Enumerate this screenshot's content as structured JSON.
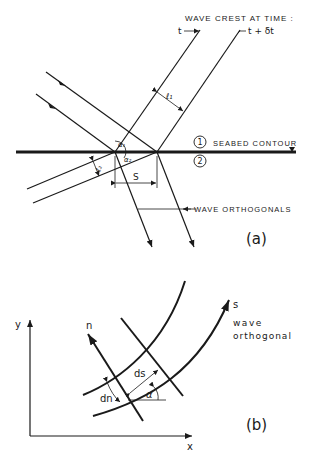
{
  "figure_a": {
    "title": "WAVE CREST AT TIME :",
    "time_t": "t",
    "time_t_dt": "t + δt",
    "label_l1": "ℓ₁",
    "label_l2": "ℓ₂",
    "label_alpha1": "α₁",
    "label_alpha2": "α₂",
    "label_s": "S",
    "region_1": "1",
    "region_2": "2",
    "seabed_label": "SEABED CONTOUR",
    "orthogonals_label": "WAVE ORTHOGONALS",
    "panel_label": "(a)"
  },
  "figure_b": {
    "axis_y": "y",
    "axis_x": "x",
    "label_n": "n",
    "label_s": "s",
    "label_ds": "ds",
    "label_dn": "dn",
    "label_alpha": "α",
    "orthogonal_label_1": "wave",
    "orthogonal_label_2": "orthogonal",
    "panel_label": "(b)"
  }
}
